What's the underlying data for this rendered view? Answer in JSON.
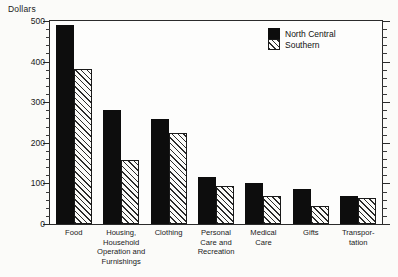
{
  "chart_data": {
    "type": "bar",
    "title": "",
    "xlabel": "",
    "ylabel": "Dollars",
    "ylim": [
      0,
      500
    ],
    "ytick_step": 100,
    "yminor_step": 20,
    "grid": false,
    "legend_position": "top-right",
    "ytick_labels": [
      "0",
      "100",
      "200",
      "300",
      "400",
      "500"
    ],
    "ytick_values": [
      0,
      100,
      200,
      300,
      400,
      500
    ],
    "categories": [
      "Food",
      "Housing,\nHousehold\nOperation and\nFurnishings",
      "Clothing",
      "Personal\nCare and\nRecreation",
      "Medical\nCare",
      "Gifts",
      "Transpor-\ntation"
    ],
    "series": [
      {
        "name": "North Central",
        "pattern": "solid",
        "color": "#0d0d0d",
        "values": [
          490,
          281,
          259,
          116,
          101,
          86,
          70
        ]
      },
      {
        "name": "Southern",
        "pattern": "diagonal-hatch",
        "color": "#2b2b2b",
        "values": [
          382,
          158,
          224,
          94,
          69,
          44,
          65
        ]
      }
    ]
  }
}
